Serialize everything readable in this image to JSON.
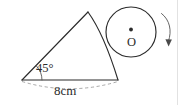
{
  "figure": {
    "kind": "geometry-diagram",
    "background_color": "#ffffff",
    "stroke_color": "#2b2b2b",
    "dashed_color": "#9a9a9a",
    "labels": {
      "angle": "45°",
      "angle_value": "45",
      "angle_unit": "degrees",
      "base_length": "8cm",
      "base_value": "8",
      "base_unit": "cm",
      "circle_center": "O"
    },
    "shapes": {
      "triangle": {
        "left_vertex": [
          22,
          80
        ],
        "apex": [
          88,
          12
        ],
        "right_vertex": [
          118,
          80
        ],
        "right_side": "arc"
      },
      "circle": {
        "center": [
          131,
          32
        ],
        "radius": 25,
        "center_dot": true
      },
      "base_dimension_arc": {
        "from": [
          22,
          82
        ],
        "to": [
          118,
          82
        ],
        "style": "dashed",
        "bulge": "downward"
      },
      "rotation_arrow": {
        "direction": "clockwise",
        "position": "right-of-circle"
      }
    }
  }
}
